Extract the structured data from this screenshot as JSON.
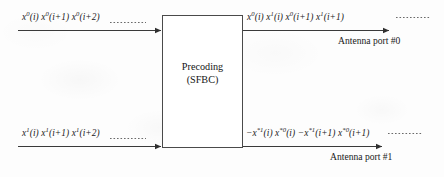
{
  "figure": {
    "block": {
      "title_line1": "Precoding",
      "title_line2": "(SFBC)"
    },
    "inputs": [
      {
        "id": "input-layer-0",
        "label_html": "x<sup>0</sup>(i) x<sup>0</sup>(i+1) x<sup>0</sup>(i+2)",
        "label_text": "x0(i) x0(i+1) x0(i+2)"
      },
      {
        "id": "input-layer-1",
        "label_html": "x<sup>1</sup>(i) x<sup>1</sup>(i+1) x<sup>1</sup>(i+2)",
        "label_text": "x1(i) x1(i+1) x1(i+2)"
      }
    ],
    "outputs": [
      {
        "id": "output-port-0",
        "label_html": "x<sup>0</sup>(i) x<sup>1</sup>(i) x<sup>0</sup>(i+1) x<sup>1</sup>(i+1)",
        "label_text": "x0(i) x1(i) x0(i+1) x1(i+1)",
        "port": "Antenna port #0"
      },
      {
        "id": "output-port-1",
        "label_html": "−x<sup>*1</sup>(i) x<sup>*0</sup>(i) −x<sup>*1</sup>(i+1) x<sup>*0</sup>(i+1)",
        "label_text": "-x*1(i) x*0(i) -x*1(i+1) x*0(i+1)",
        "port": "Antenna port #1"
      }
    ],
    "colors": {
      "line": "#3a3a3a",
      "box_border": "#4a4a4a",
      "text": "#1a1a1a",
      "background": "#fdfdfd"
    }
  }
}
